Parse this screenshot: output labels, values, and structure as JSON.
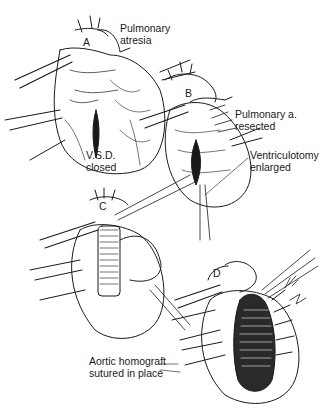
{
  "figure": {
    "panels": [
      {
        "letter": "A",
        "x": 83,
        "y": 36
      },
      {
        "letter": "B",
        "x": 185,
        "y": 87
      },
      {
        "letter": "C",
        "x": 99,
        "y": 200
      },
      {
        "letter": "D",
        "x": 213,
        "y": 267
      }
    ],
    "labels": [
      {
        "id": "pulmonary-atresia",
        "text": "Pulmonary\natresia",
        "x": 120,
        "y": 22
      },
      {
        "id": "pulmonary-a-resected",
        "text": "Pulmonary a.\nresected",
        "x": 235,
        "y": 108
      },
      {
        "id": "vsd-closed",
        "text": "V.S.D.\nclosed",
        "x": 86,
        "y": 149
      },
      {
        "id": "ventriculotomy-enlarged",
        "text": "Ventriculotomy\nenlarged",
        "x": 250,
        "y": 149
      },
      {
        "id": "aortic-homograft",
        "text": "Aortic homograft\nsutured in place",
        "x": 89,
        "y": 355
      }
    ],
    "annotation": {
      "signature": "Hof. / 75"
    },
    "colors": {
      "ink": "#1a1a1a",
      "paper": "#ffffff"
    }
  }
}
